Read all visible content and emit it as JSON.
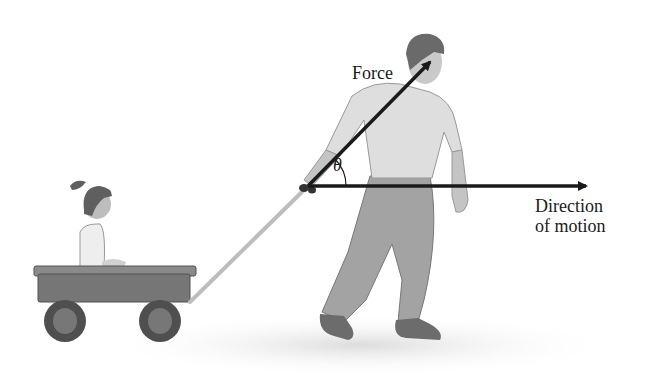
{
  "diagram": {
    "labels": {
      "force": "Force",
      "angle": "θ",
      "direction_line1": "Direction",
      "direction_line2": "of motion"
    },
    "colors": {
      "arrow": "#1a1a1a",
      "wagon": "#6e6e6e",
      "wheel": "#555555",
      "shirt": "#d9d9d9",
      "pants": "#9a9a9a",
      "hair": "#6a6a6a",
      "skin": "#c8c8c8",
      "ground_shadow": "#e3e3e3"
    }
  }
}
